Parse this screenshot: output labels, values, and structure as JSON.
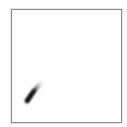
{
  "canvas": {
    "border_color": "#8a8a8a",
    "background": "#ffffff",
    "strokes": [
      {
        "type": "brush",
        "color": "#1a1a1a",
        "from": [
          15,
          91
        ],
        "to": [
          29,
          73
        ]
      }
    ]
  }
}
